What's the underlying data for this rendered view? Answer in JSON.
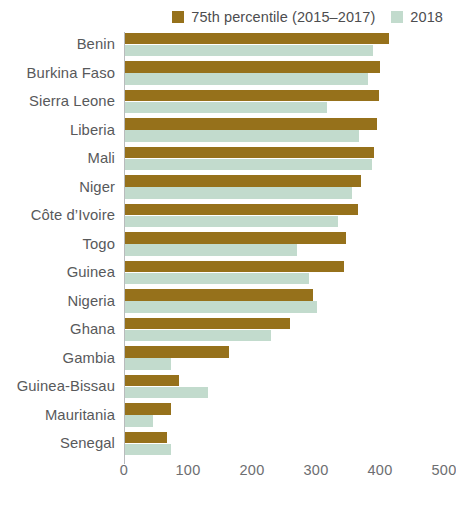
{
  "chart_data": {
    "type": "bar",
    "orientation": "horizontal",
    "title": "",
    "subtitle": "",
    "xlabel": "",
    "ylabel": "",
    "xlim": [
      0,
      500
    ],
    "xticks": [
      0,
      100,
      200,
      300,
      400,
      500
    ],
    "xtick_labels": [
      "0",
      "100",
      "200",
      "300",
      "400",
      "500"
    ],
    "grid": false,
    "legend_position": "top-right",
    "categories": [
      "Benin",
      "Burkina Faso",
      "Sierra Leone",
      "Liberia",
      "Mali",
      "Niger",
      "Côte d’Ivoire",
      "Togo",
      "Guinea",
      "Nigeria",
      "Ghana",
      "Gambia",
      "Guinea-Bissau",
      "Mauritania",
      "Senegal"
    ],
    "series": [
      {
        "name": "75th percentile (2015–2017)",
        "color": "#96711b",
        "values": [
          413,
          398,
          397,
          394,
          389,
          369,
          364,
          345,
          342,
          294,
          258,
          162,
          84,
          72,
          66
        ]
      },
      {
        "name": "2018",
        "color": "#c2dbcd",
        "values": [
          388,
          380,
          316,
          366,
          386,
          355,
          333,
          269,
          288,
          300,
          228,
          72,
          130,
          44,
          72
        ]
      }
    ]
  },
  "legend": {
    "items": [
      {
        "label": "75th percentile (2015–2017)",
        "color": "#96711b"
      },
      {
        "label": "2018",
        "color": "#c2dbcd"
      }
    ]
  },
  "colors": {
    "series_p75": "#96711b",
    "series_2018": "#c2dbcd",
    "axis": "#b9bbbd",
    "text": "#58595b",
    "background": "#ffffff"
  }
}
